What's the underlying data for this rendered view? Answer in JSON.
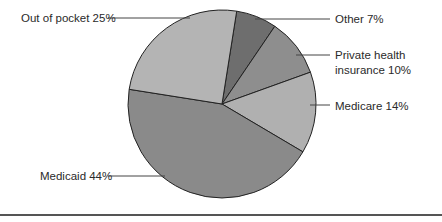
{
  "chart_data": {
    "type": "pie",
    "title": "",
    "start_angle_deg": -81,
    "direction": "clockwise",
    "center": [
      222,
      104
    ],
    "radius": 94,
    "slices": [
      {
        "label": "Other",
        "value": 7,
        "display": "Other 7%",
        "color": "#6e6e6e"
      },
      {
        "label": "Private health insurance",
        "value": 10,
        "display_lines": [
          "Private health",
          "insurance 10%"
        ],
        "color": "#8e8e8e"
      },
      {
        "label": "Medicare",
        "value": 14,
        "display": "Medicare 14%",
        "color": "#b0b0b0"
      },
      {
        "label": "Medicaid",
        "value": 44,
        "display": "Medicaid 44%",
        "color": "#8a8a8a"
      },
      {
        "label": "Out of pocket",
        "value": 25,
        "display": "Out of pocket 25%",
        "color": "#b4b4b4"
      }
    ],
    "labels": {
      "other": "Other 7%",
      "private_line1": "Private health",
      "private_line2": "insurance 10%",
      "medicare": "Medicare 14%",
      "medicaid": "Medicaid 44%",
      "out_of_pocket": "Out of pocket 25%"
    }
  }
}
